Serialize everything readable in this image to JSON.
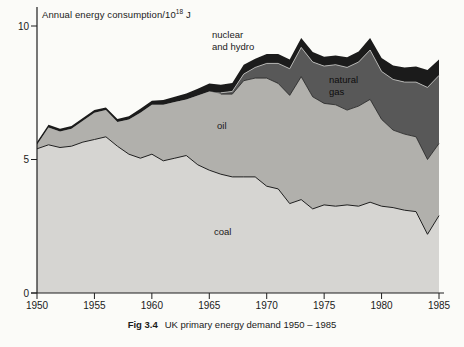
{
  "figure": {
    "y_axis_title_base": "Annual energy consumption/10",
    "y_axis_title_exponent": "18",
    "y_axis_title_unit": " J",
    "caption_label": "Fig 3.4",
    "caption_text": "UK primary energy demand 1950 – 1985"
  },
  "colors": {
    "background": "#fbfbf8",
    "coal": "#d6d5d2",
    "oil": "#b1b0ac",
    "natural_gas": "#585858",
    "nuclear_hydro": "#1b1b1b",
    "line": "#1f1f1f",
    "text": "#1a1a1a",
    "gas_top_highlight": "#c9c9c6"
  },
  "chart_data": {
    "type": "area",
    "stacked": true,
    "caption": "Fig 3.4 UK primary energy demand 1950 - 1985",
    "xlim": [
      1950,
      1985
    ],
    "ylim": [
      0,
      10
    ],
    "x_ticks": [
      1950,
      1955,
      1960,
      1965,
      1970,
      1975,
      1980,
      1985
    ],
    "y_ticks": [
      0,
      5,
      10
    ],
    "x": [
      1950,
      1951,
      1952,
      1953,
      1954,
      1955,
      1956,
      1957,
      1958,
      1959,
      1960,
      1961,
      1962,
      1963,
      1964,
      1965,
      1966,
      1967,
      1968,
      1969,
      1970,
      1971,
      1972,
      1973,
      1974,
      1975,
      1976,
      1977,
      1978,
      1979,
      1980,
      1981,
      1982,
      1983,
      1984,
      1985
    ],
    "series": [
      {
        "name": "coal",
        "values": [
          5.4,
          5.55,
          5.45,
          5.5,
          5.65,
          5.75,
          5.85,
          5.5,
          5.2,
          5.05,
          5.2,
          4.95,
          5.05,
          5.15,
          4.8,
          4.6,
          4.45,
          4.35,
          4.35,
          4.35,
          4.0,
          3.9,
          3.35,
          3.5,
          3.15,
          3.3,
          3.25,
          3.3,
          3.25,
          3.4,
          3.25,
          3.2,
          3.1,
          3.05,
          2.2,
          2.9
        ]
      },
      {
        "name": "oil",
        "values": [
          0.15,
          0.65,
          0.6,
          0.65,
          0.8,
          1.0,
          1.0,
          0.9,
          1.3,
          1.7,
          1.85,
          2.1,
          2.1,
          2.1,
          2.6,
          2.95,
          3.0,
          3.1,
          3.6,
          3.7,
          4.05,
          3.95,
          4.05,
          4.6,
          4.2,
          3.8,
          3.8,
          3.55,
          3.75,
          3.85,
          3.25,
          2.9,
          2.85,
          2.8,
          2.8,
          2.7
        ]
      },
      {
        "name": "natural gas",
        "values": [
          0,
          0,
          0,
          0,
          0,
          0,
          0,
          0,
          0,
          0,
          0,
          0,
          0,
          0,
          0,
          0,
          0.05,
          0.1,
          0.25,
          0.4,
          0.55,
          0.75,
          1.0,
          1.1,
          1.3,
          1.4,
          1.5,
          1.6,
          1.65,
          1.85,
          1.8,
          1.9,
          1.95,
          2.05,
          2.7,
          2.55
        ]
      },
      {
        "name": "nuclear and hydro",
        "values": [
          0.1,
          0.1,
          0.1,
          0.1,
          0.1,
          0.1,
          0.1,
          0.12,
          0.12,
          0.15,
          0.15,
          0.18,
          0.2,
          0.22,
          0.25,
          0.3,
          0.3,
          0.32,
          0.35,
          0.32,
          0.35,
          0.35,
          0.35,
          0.35,
          0.38,
          0.35,
          0.35,
          0.38,
          0.4,
          0.45,
          0.5,
          0.52,
          0.55,
          0.58,
          0.65,
          0.6
        ]
      }
    ],
    "annotations": {
      "nuclear_hydro": "nuclear\nand hydro",
      "natural_gas": "natural\ngas",
      "oil": "oil",
      "coal": "coal"
    },
    "legend": "labels drawn inside plot areas",
    "grid": false
  }
}
